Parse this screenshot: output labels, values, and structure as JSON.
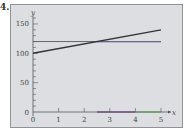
{
  "problem_label": "4.",
  "colors": {
    "panel_bg": "#dcdee2",
    "panel_border": "#8f9297",
    "axis": "#555555",
    "line_sloped": "#333338",
    "line_horizontal": "#55585c",
    "line_horizontal_tint": "#8f8fd0",
    "segment_purple": "#a070b0",
    "segment_green": "#8fd08f"
  },
  "chart_data": {
    "type": "line",
    "title": "",
    "xlabel": "x",
    "ylabel": "y",
    "xlim": [
      0,
      5
    ],
    "ylim": [
      0,
      160
    ],
    "x_ticks": [
      0,
      1,
      2,
      3,
      4,
      5
    ],
    "x_tick_labels": [
      "0",
      "1",
      "2",
      "3",
      "4",
      "5"
    ],
    "y_ticks_minor_step": 10,
    "y_tick_labels": [
      "0",
      "50",
      "100",
      "150"
    ],
    "y_tick_label_values": [
      0,
      50,
      100,
      150
    ],
    "grid": false,
    "legend": null,
    "series": [
      {
        "name": "sloped line",
        "x": [
          0,
          5
        ],
        "y": [
          100,
          140
        ]
      },
      {
        "name": "horizontal line",
        "x": [
          0,
          5
        ],
        "y": [
          120,
          120
        ]
      }
    ],
    "annotations": [
      {
        "type": "x-axis-highlight",
        "color": "purple",
        "from": 2.5,
        "to": 4
      },
      {
        "type": "x-axis-highlight",
        "color": "green",
        "from": 4,
        "to": 5
      }
    ]
  }
}
